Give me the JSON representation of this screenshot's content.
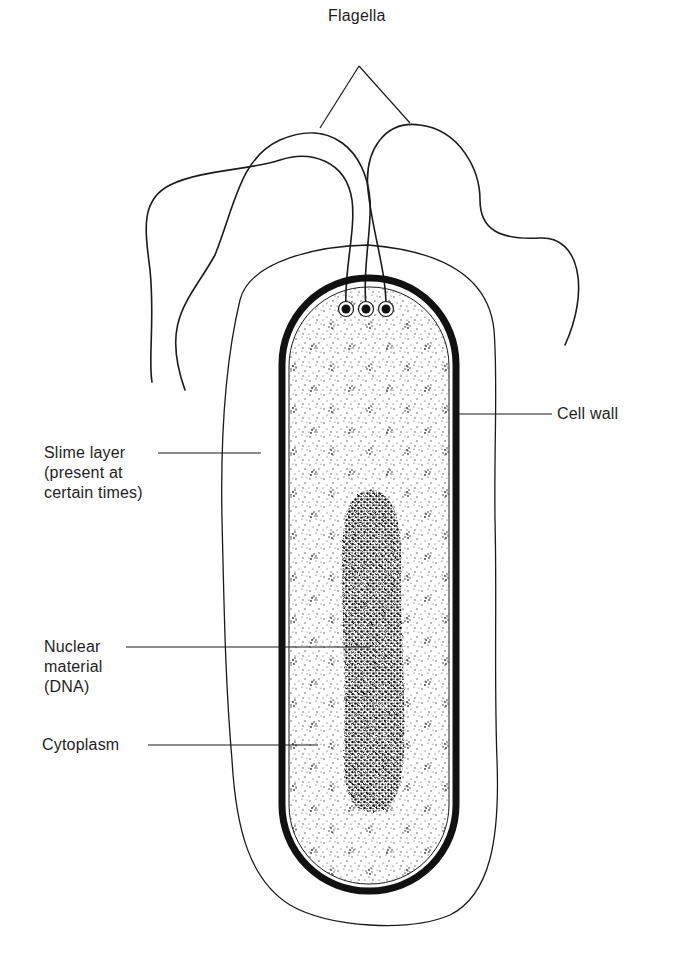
{
  "figure": {
    "colors": {
      "ink": "#1a1a1a",
      "background": "#ffffff",
      "cytoplasm_stipple": "#3a3a3a",
      "nucleoid": "#111111"
    }
  },
  "labels": {
    "flagella": "Flagella",
    "cell_wall": "Cell wall",
    "slime_layer": {
      "line1": "Slime layer",
      "line2": "(present at",
      "line3": "certain times)"
    },
    "nuclear_material": {
      "line1": "Nuclear",
      "line2": "material",
      "line3": "(DNA)"
    },
    "cytoplasm": "Cytoplasm"
  },
  "structures": [
    {
      "name": "Flagella",
      "count": 3
    },
    {
      "name": "Basal bodies",
      "count": 3
    },
    {
      "name": "Cell wall"
    },
    {
      "name": "Slime layer"
    },
    {
      "name": "Cytoplasm"
    },
    {
      "name": "Nuclear material (DNA)"
    }
  ]
}
